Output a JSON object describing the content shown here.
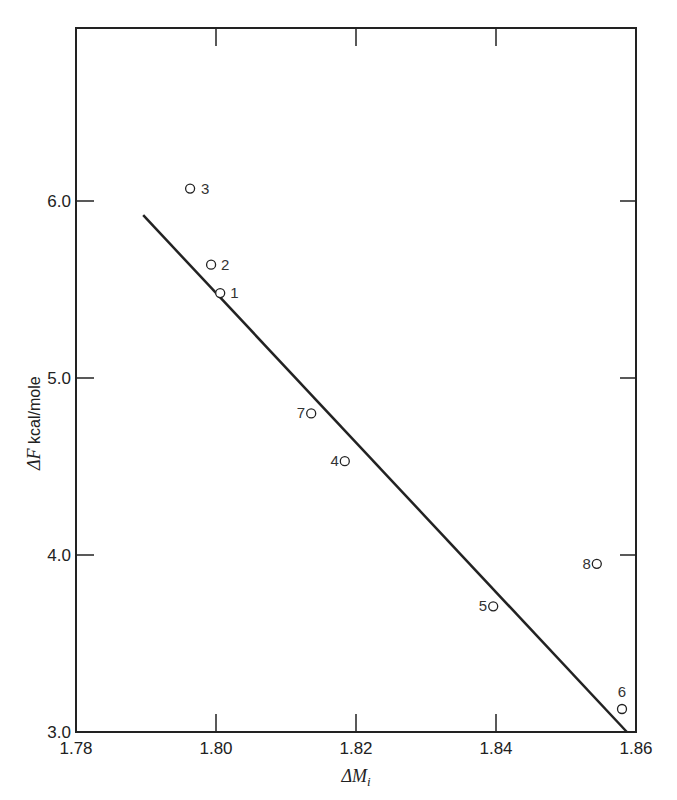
{
  "chart_data": {
    "type": "scatter",
    "title": "",
    "xlabel": "ΔM_i",
    "ylabel": "ΔF kcal/mole",
    "xlim": [
      1.78,
      1.86
    ],
    "ylim": [
      3.0,
      6.3
    ],
    "x_ticks": [
      "1.78",
      "1.80",
      "1.82",
      "1.84",
      "1.86"
    ],
    "y_ticks": [
      "3.0",
      "4.0",
      "5.0",
      "6.0"
    ],
    "grid": false,
    "legend": null,
    "series": [
      {
        "name": "data points",
        "marker": "open-circle",
        "points": [
          {
            "label": "1",
            "x": 1.8006,
            "y": 5.48
          },
          {
            "label": "2",
            "x": 1.7993,
            "y": 5.64
          },
          {
            "label": "3",
            "x": 1.7963,
            "y": 6.07
          },
          {
            "label": "4",
            "x": 1.8184,
            "y": 4.53
          },
          {
            "label": "5",
            "x": 1.8396,
            "y": 3.71
          },
          {
            "label": "6",
            "x": 1.858,
            "y": 3.13
          },
          {
            "label": "7",
            "x": 1.8136,
            "y": 4.8
          },
          {
            "label": "8",
            "x": 1.8544,
            "y": 3.95
          }
        ]
      },
      {
        "name": "fit line",
        "type": "line",
        "points": [
          {
            "x": 1.7896,
            "y": 5.92
          },
          {
            "x": 1.8587,
            "y": 3.0
          }
        ]
      }
    ]
  },
  "axes": {
    "x_title_main": "ΔM",
    "x_title_sub": "i",
    "y_title_main": "ΔF",
    "y_title_unit": " kcal/mole"
  },
  "colors": {
    "ink": "#222222",
    "background": "#ffffff"
  }
}
